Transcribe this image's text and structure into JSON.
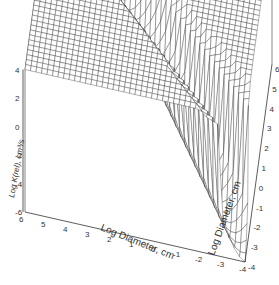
{
  "chart_data": {
    "type": "surface3d",
    "title": "",
    "x_axis": {
      "label": "Log Diameter, cm",
      "range": [
        -4,
        6
      ],
      "ticks": [
        "6",
        "5",
        "4",
        "3",
        "2",
        "1",
        "0",
        "-1",
        "-2",
        "-3",
        "-4"
      ]
    },
    "y_axis": {
      "label": "Log Diameter, cm",
      "range": [
        -4,
        6
      ],
      "ticks": [
        "-4",
        "-3",
        "-2",
        "-1",
        "0",
        "1",
        "2",
        "3",
        "4",
        "5",
        "6"
      ]
    },
    "z_axis": {
      "label": "Log K(rel), cm³/s",
      "range": [
        -6,
        4
      ],
      "ticks": [
        "-6",
        "-5",
        "-4",
        "-3",
        "-2",
        "-1",
        "0",
        "1",
        "2",
        "3",
        "4"
      ]
    },
    "grid_resolution": 40,
    "surface_description": "Symmetric kernel surface: high plateau (z≈4) where one diameter is large and the other small, deep valley along the diagonal, minimum near (-4,-4)",
    "surface_samples": [
      {
        "x": 6,
        "y": -4,
        "z": 4
      },
      {
        "x": -4,
        "y": 6,
        "z": 4
      },
      {
        "x": 6,
        "y": 6,
        "z": 2
      },
      {
        "x": 0,
        "y": 0,
        "z": -2
      },
      {
        "x": -4,
        "y": -4,
        "z": -6
      }
    ],
    "wire_color": "#222222",
    "face_color": "#ffffff"
  }
}
